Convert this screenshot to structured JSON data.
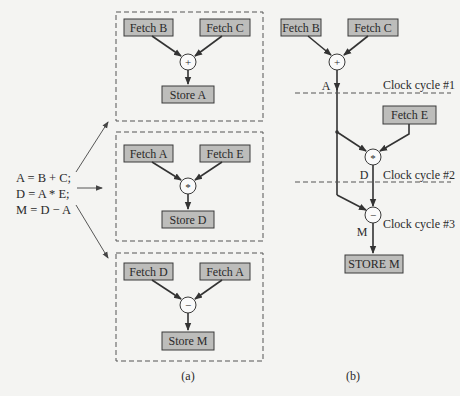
{
  "figure": {
    "panel_a": {
      "caption": "(a)",
      "equations": [
        "A = B + C;",
        "D = A * E;",
        "M = D − A"
      ],
      "groups": [
        {
          "inputs": [
            "Fetch B",
            "Fetch C"
          ],
          "operator": "+",
          "output": "Store A"
        },
        {
          "inputs": [
            "Fetch A",
            "Fetch E"
          ],
          "operator": "*",
          "output": "Store D"
        },
        {
          "inputs": [
            "Fetch D",
            "Fetch A"
          ],
          "operator": "−",
          "output": "Store M"
        }
      ]
    },
    "panel_b": {
      "caption": "(b)",
      "fetch_b": "Fetch B",
      "fetch_c": "Fetch C",
      "fetch_e": "Fetch E",
      "op_add": "+",
      "op_mul": "*",
      "op_sub": "−",
      "label_a": "A",
      "label_d": "D",
      "label_m": "M",
      "store_m": "STORE M",
      "clock_cycles": [
        "Clock cycle #1",
        "Clock cycle #2",
        "Clock cycle #3"
      ]
    }
  }
}
